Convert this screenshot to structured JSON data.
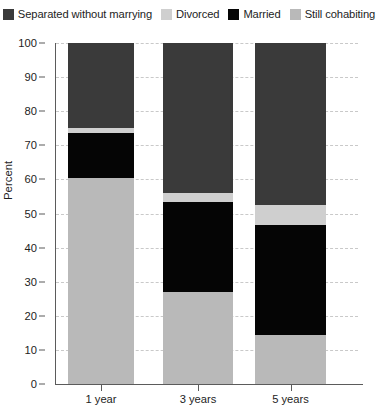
{
  "chart_data": {
    "type": "bar",
    "subtype": "stacked-bar-100",
    "title": "",
    "xlabel": "",
    "ylabel": "Percent",
    "ylim": [
      0,
      100
    ],
    "yticks": [
      0,
      10,
      20,
      30,
      40,
      50,
      60,
      70,
      80,
      90,
      100
    ],
    "grid": true,
    "legend_position": "top",
    "categories": [
      "1 year",
      "3 years",
      "5 years"
    ],
    "series": [
      {
        "name": "Still cohabiting",
        "color": "#b9b9b9",
        "values": [
          60.5,
          27.0,
          14.5
        ]
      },
      {
        "name": "Married",
        "color": "#050505",
        "values": [
          13.2,
          26.5,
          32.0
        ]
      },
      {
        "name": "Divorced",
        "color": "#cfcfcf",
        "values": [
          1.5,
          2.5,
          6.0
        ]
      },
      {
        "name": "Separated without marrying",
        "color": "#3a3a3a",
        "values": [
          24.8,
          44.0,
          47.5
        ]
      }
    ]
  },
  "legend": {
    "items": [
      {
        "label": "Separated without marrying",
        "color": "#3a3a3a"
      },
      {
        "label": "Divorced",
        "color": "#cfcfcf"
      },
      {
        "label": "Married",
        "color": "#050505"
      },
      {
        "label": "Still cohabiting",
        "color": "#b9b9b9"
      }
    ]
  },
  "axes": {
    "y_title": "Percent",
    "y_tick_labels": [
      "100",
      "90",
      "80",
      "70",
      "60",
      "50",
      "40",
      "30",
      "20",
      "10",
      "0"
    ],
    "x_tick_labels": [
      "1 year",
      "3 years",
      "5 years"
    ]
  },
  "colors": {
    "separated": "#3a3a3a",
    "divorced": "#cfcfcf",
    "married": "#050505",
    "cohabiting": "#b9b9b9",
    "axis": "#5b5b5b",
    "grid": "#c9c9c9",
    "text": "#1d1d1d",
    "background": "#ffffff"
  }
}
